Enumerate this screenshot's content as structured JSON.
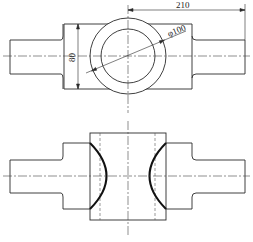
{
  "drawing": {
    "type": "engineering-drawing",
    "views": [
      "top-view",
      "front-view"
    ],
    "line_color": "#2a2a2a",
    "background": "#ffffff"
  },
  "dimensions": {
    "length": "210",
    "height": "80",
    "diameter": "φ100"
  }
}
